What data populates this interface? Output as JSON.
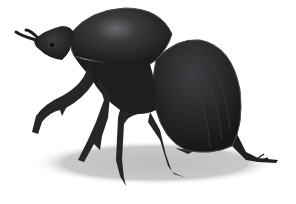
{
  "image": {
    "subject": "beetle illustration",
    "description": "Dark grayscale illustration of a beetle standing in profile facing left, with a soft gray ground shadow",
    "colors": {
      "background": "#ffffff",
      "body": "#1e1e20",
      "body_mid": "#2e2e31",
      "highlight": "#6a6a6e",
      "shadow": "#c8c8c8",
      "outline": "#4a4a4e"
    }
  }
}
